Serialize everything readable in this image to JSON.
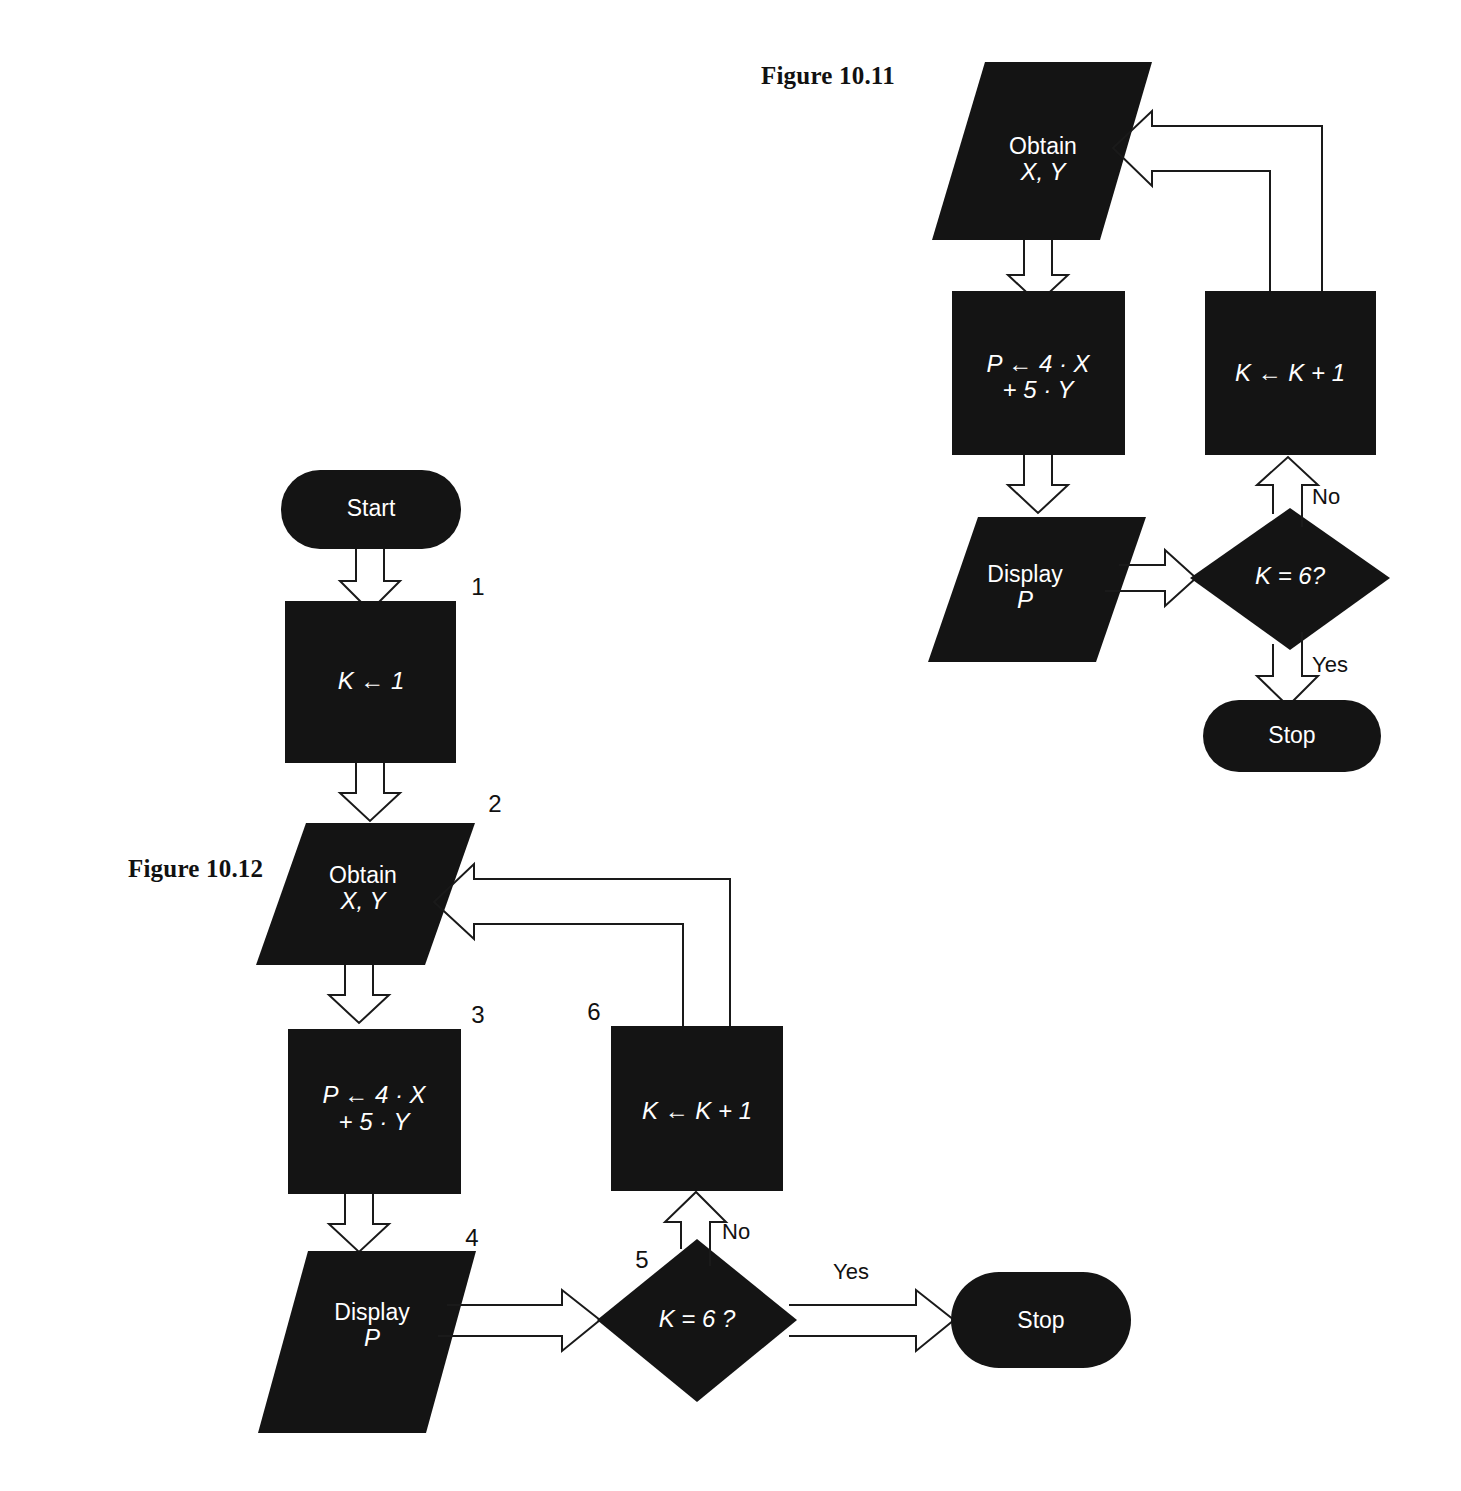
{
  "page": {
    "background": "#ffffff",
    "shape_fill": "#141414",
    "text_on_shape": "#ffffff",
    "line_color": "#1a1a1a"
  },
  "figures": [
    {
      "id": "figure-10-11",
      "caption": "Figure 10.11",
      "nodes": [
        {
          "id": "obtain",
          "type": "parallelogram",
          "lines": [
            "Obtain",
            "X, Y"
          ],
          "step": ""
        },
        {
          "id": "compute",
          "type": "process",
          "lines": [
            "P ← 4 · X",
            "+ 5 · Y"
          ],
          "step": ""
        },
        {
          "id": "display",
          "type": "parallelogram",
          "lines": [
            "Display",
            "P"
          ],
          "step": ""
        },
        {
          "id": "decide",
          "type": "decision",
          "lines": [
            "K = 6?"
          ],
          "step": ""
        },
        {
          "id": "incr",
          "type": "process",
          "lines": [
            "K ← K + 1"
          ],
          "step": ""
        },
        {
          "id": "stop",
          "type": "terminal",
          "lines": [
            "Stop"
          ],
          "step": ""
        }
      ],
      "edge_labels": {
        "no": "No",
        "yes": "Yes"
      }
    },
    {
      "id": "figure-10-12",
      "caption": "Figure 10.12",
      "nodes": [
        {
          "id": "start",
          "type": "terminal",
          "lines": [
            "Start"
          ],
          "step": ""
        },
        {
          "id": "init",
          "type": "process",
          "lines": [
            "K ← 1"
          ],
          "step": "1"
        },
        {
          "id": "obtain",
          "type": "parallelogram",
          "lines": [
            "Obtain",
            "X, Y"
          ],
          "step": "2"
        },
        {
          "id": "compute",
          "type": "process",
          "lines": [
            "P ← 4 · X",
            "+ 5 · Y"
          ],
          "step": "3"
        },
        {
          "id": "display",
          "type": "parallelogram",
          "lines": [
            "Display",
            "P"
          ],
          "step": "4"
        },
        {
          "id": "decide",
          "type": "decision",
          "lines": [
            "K = 6 ?"
          ],
          "step": "5"
        },
        {
          "id": "incr",
          "type": "process",
          "lines": [
            "K ← K + 1"
          ],
          "step": "6"
        },
        {
          "id": "stop",
          "type": "terminal",
          "lines": [
            "Stop"
          ],
          "step": ""
        }
      ],
      "edge_labels": {
        "no": "No",
        "yes": "Yes"
      }
    }
  ]
}
